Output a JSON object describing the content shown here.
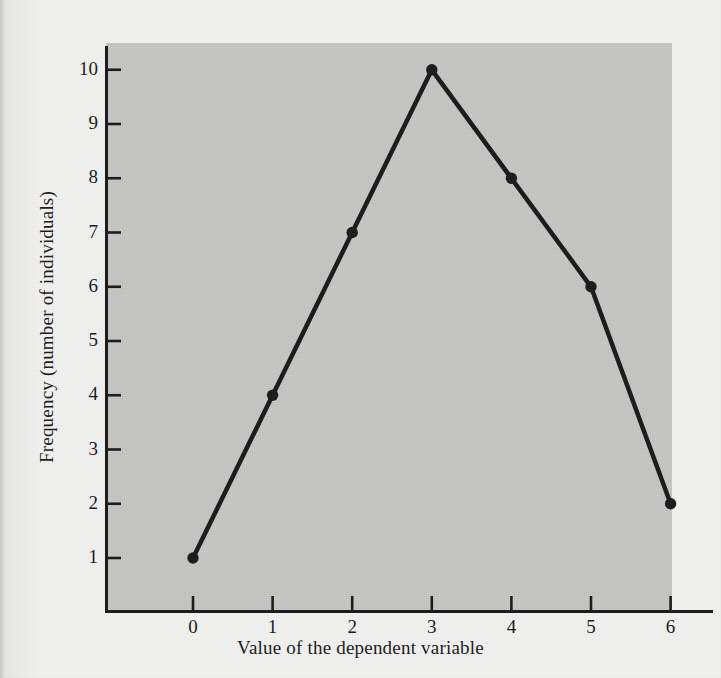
{
  "figure": {
    "background_color": "#f1f1ef",
    "plot_background_color": "#c8c8c6",
    "ink_color": "#1d1d1d"
  },
  "chart_data": {
    "type": "line",
    "title": "",
    "subtitle": "",
    "xlabel": "Value of the dependent variable",
    "ylabel": "Frequency (number of individuals)",
    "x": [
      0,
      1,
      2,
      3,
      4,
      5,
      6
    ],
    "values": [
      1,
      4,
      7,
      10,
      8,
      6,
      2
    ],
    "series": [
      {
        "name": "Frequency",
        "values": [
          1,
          4,
          7,
          10,
          8,
          6,
          2
        ]
      }
    ],
    "xtick_labels": [
      "0",
      "1",
      "2",
      "3",
      "4",
      "5",
      "6"
    ],
    "ytick_labels": [
      "1",
      "2",
      "3",
      "4",
      "5",
      "6",
      "7",
      "8",
      "9",
      "10"
    ],
    "xlim": [
      -0.35,
      6.4
    ],
    "ylim": [
      0.1,
      10.45
    ],
    "grid": false,
    "legend": false,
    "legend_position": "none",
    "marker": "filled-circle",
    "marker_size": 9,
    "line_width": 4,
    "line_color": "#1d1d1d",
    "tick_direction": "in",
    "annotations": []
  },
  "axes": {
    "x_title": "Value of the dependent variable",
    "y_title": "Frequency (number of individuals)"
  }
}
